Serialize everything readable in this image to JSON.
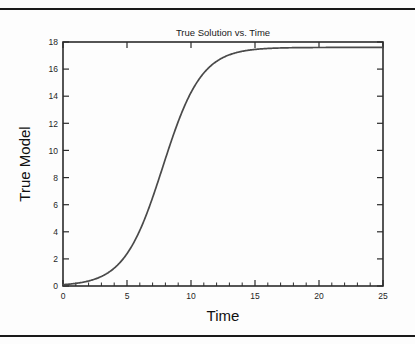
{
  "figure": {
    "title": "True Solution vs. Time",
    "background_color": "#fdfdfd",
    "axis_color": "#2b2b2b",
    "curve_color": "#4a4a4a",
    "rule_color": "#1a1a1a"
  },
  "chart_data": {
    "type": "line",
    "title": "True Solution vs. Time",
    "xlabel": "Time",
    "ylabel": "True Model",
    "xlim": [
      0,
      25
    ],
    "ylim": [
      0,
      18
    ],
    "xticks": [
      0,
      5,
      10,
      15,
      20,
      25
    ],
    "xtick_labels": [
      "0",
      "5",
      "10",
      "15",
      "20",
      "25"
    ],
    "yticks": [
      0,
      2,
      4,
      6,
      8,
      10,
      12,
      14,
      16,
      18
    ],
    "ytick_labels": [
      "0",
      "2",
      "4",
      "6",
      "8",
      "10",
      "12",
      "14",
      "16",
      "18"
    ],
    "minor_xticks": [
      1,
      2,
      3,
      4,
      6,
      7,
      8,
      9,
      11,
      12,
      13,
      14,
      16,
      17,
      18,
      19,
      21,
      22,
      23,
      24
    ],
    "grid": false,
    "legend": null,
    "series": [
      {
        "name": "True Model",
        "color": "#4a4a4a",
        "x": [
          0,
          0.5,
          1,
          1.5,
          2,
          2.5,
          3,
          3.5,
          4,
          4.5,
          5,
          5.5,
          6,
          6.5,
          7,
          7.5,
          8,
          8.5,
          9,
          9.5,
          10,
          10.5,
          11,
          11.5,
          12,
          12.5,
          13,
          13.5,
          14,
          14.5,
          15,
          16,
          17,
          18,
          19,
          20,
          21,
          22,
          23,
          24,
          25
        ],
        "y": [
          0.1,
          0.13,
          0.17,
          0.22,
          0.29,
          0.38,
          0.5,
          0.65,
          0.85,
          1.11,
          1.44,
          1.86,
          2.39,
          3.05,
          3.86,
          4.82,
          5.95,
          7.21,
          8.56,
          9.92,
          11.22,
          12.39,
          13.38,
          14.19,
          14.84,
          15.34,
          15.73,
          16.02,
          16.24,
          16.4,
          16.53,
          16.7,
          16.81,
          16.88,
          16.93,
          16.96,
          16.98,
          17.0,
          17.01,
          17.02,
          17.02
        ]
      }
    ],
    "model": {
      "form": "logistic",
      "carrying_capacity": 17.6,
      "inflection_time": 7.8,
      "initial_value": 0.1
    }
  }
}
